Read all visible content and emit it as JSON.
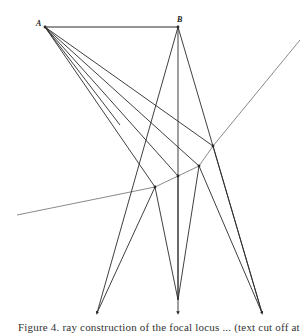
{
  "labels": {
    "point_a": "A",
    "point_b": "B"
  },
  "caption": "Figure 4. ray construction of the focal locus ... (text cut off at bottom edge)",
  "colors": {
    "ray": "#2a2a2a",
    "curve": "#8a8a8a",
    "background": "#ffffff"
  },
  "geometry": {
    "A": [
      45,
      27
    ],
    "B": [
      178,
      27
    ],
    "curve_points": [
      [
        17,
        215
      ],
      [
        155,
        187
      ],
      [
        178,
        176
      ],
      [
        199,
        166
      ],
      [
        213,
        146
      ],
      [
        300,
        40
      ]
    ],
    "curve_nodes": [
      [
        155,
        187
      ],
      [
        178,
        176
      ],
      [
        199,
        166
      ],
      [
        213,
        146
      ]
    ],
    "bottom_targets": [
      [
        97,
        313
      ],
      [
        178,
        313
      ],
      [
        262,
        313
      ]
    ],
    "rays_from_A": [
      [
        [
          45,
          27
        ],
        [
          155,
          187
        ]
      ],
      [
        [
          45,
          27
        ],
        [
          178,
          176
        ]
      ],
      [
        [
          45,
          27
        ],
        [
          199,
          166
        ]
      ],
      [
        [
          45,
          27
        ],
        [
          213,
          146
        ]
      ],
      [
        [
          45,
          27
        ],
        [
          235,
          160
        ]
      ]
    ],
    "rays_from_B": [
      [
        [
          178,
          27
        ],
        [
          155,
          187
        ]
      ],
      [
        [
          178,
          27
        ],
        [
          178,
          313
        ]
      ],
      [
        [
          178,
          27
        ],
        [
          262,
          313
        ]
      ]
    ],
    "reflected_rays": [
      [
        [
          155,
          187
        ],
        [
          97,
          313
        ]
      ],
      [
        [
          155,
          187
        ],
        [
          178,
          313
        ]
      ],
      [
        [
          178,
          176
        ],
        [
          97,
          313
        ]
      ],
      [
        [
          199,
          166
        ],
        [
          178,
          313
        ]
      ],
      [
        [
          199,
          166
        ],
        [
          262,
          313
        ]
      ],
      [
        [
          213,
          146
        ],
        [
          262,
          313
        ]
      ]
    ]
  }
}
